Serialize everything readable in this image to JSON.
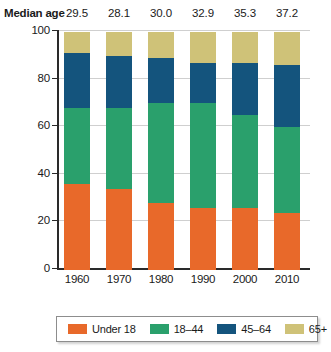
{
  "header": {
    "median_age_label": "Median age",
    "median_ages": [
      "29.5",
      "28.1",
      "30.0",
      "32.9",
      "35.3",
      "37.2"
    ]
  },
  "axes": {
    "y_title": "Percentage",
    "x_title": "Year",
    "y_ticks": [
      "100",
      "80",
      "60",
      "40",
      "20",
      "0"
    ],
    "x_ticks": [
      "1960",
      "1970",
      "1980",
      "1990",
      "2000",
      "2010"
    ]
  },
  "legend": {
    "items": [
      {
        "label": "Under 18",
        "color": "#e8692a"
      },
      {
        "label": "18–44",
        "color": "#2aa06c"
      },
      {
        "label": "45–64",
        "color": "#14547d"
      },
      {
        "label": "65+",
        "color": "#cfc278"
      }
    ]
  },
  "chart_data": {
    "type": "bar",
    "title": "",
    "xlabel": "Year",
    "ylabel": "Percentage",
    "ylim": [
      0,
      100
    ],
    "grid": true,
    "stacked": true,
    "legend_position": "bottom",
    "categories": [
      "1960",
      "1970",
      "1980",
      "1990",
      "2000",
      "2010"
    ],
    "median_age": [
      29.5,
      28.1,
      30.0,
      32.9,
      35.3,
      37.2
    ],
    "series": [
      {
        "name": "Under 18",
        "color": "#e8692a",
        "values": [
          36,
          34,
          28,
          26,
          26,
          24
        ]
      },
      {
        "name": "18–44",
        "color": "#2aa06c",
        "values": [
          32,
          34,
          42,
          44,
          39,
          36
        ]
      },
      {
        "name": "45–64",
        "color": "#14547d",
        "values": [
          23,
          22,
          19,
          17,
          22,
          26
        ]
      },
      {
        "name": "65+",
        "color": "#cfc278",
        "values": [
          9,
          10,
          11,
          13,
          13,
          14
        ]
      }
    ]
  }
}
